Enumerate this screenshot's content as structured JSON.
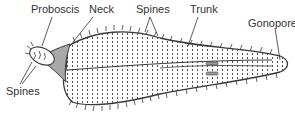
{
  "diagram": {
    "labels": {
      "proboscis": "Proboscis",
      "neck": "Neck",
      "spines_top": "Spines",
      "trunk": "Trunk",
      "gonopore": "Gonopore",
      "spines_left": "Spines"
    },
    "colors": {
      "outline": "#3a3a3a",
      "neck_fill": "#a8a8a8",
      "body_fill": "#ffffff",
      "text": "#333333"
    }
  }
}
